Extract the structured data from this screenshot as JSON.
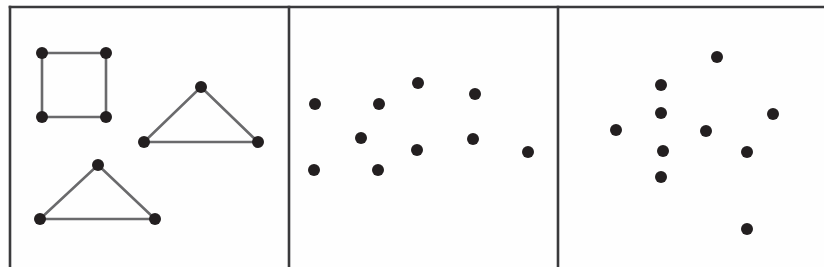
{
  "figure": {
    "background_color": "#fefefe",
    "width": 824,
    "height": 267,
    "frame_color": "#3a3a3c",
    "edge_color": "#6a6a6c",
    "dot_color": "#231f20",
    "dot_radius": 6,
    "frame": {
      "top_border": {
        "x1": 10,
        "y1": 7,
        "x2": 824,
        "y2": 7
      },
      "left_border": {
        "x1": 10,
        "y1": 7,
        "x2": 10,
        "y2": 267
      },
      "divider_1": {
        "x1": 289,
        "y1": 7,
        "x2": 289,
        "y2": 267
      },
      "divider_2": {
        "x1": 558,
        "y1": 7,
        "x2": 558,
        "y2": 267
      }
    },
    "panels": [
      {
        "id": "panel-1",
        "name": "connected-shapes-panel",
        "description": "Dots connected by line segments forming one square and two triangles",
        "shapes": [
          {
            "name": "square",
            "closed": true,
            "vertices": [
              {
                "x": 42,
                "y": 53
              },
              {
                "x": 106,
                "y": 53
              },
              {
                "x": 106,
                "y": 117
              },
              {
                "x": 42,
                "y": 117
              }
            ]
          },
          {
            "name": "upper-right-triangle",
            "closed": true,
            "vertices": [
              {
                "x": 201,
                "y": 87
              },
              {
                "x": 258,
                "y": 142
              },
              {
                "x": 144,
                "y": 142
              }
            ]
          },
          {
            "name": "lower-left-triangle",
            "closed": true,
            "vertices": [
              {
                "x": 98,
                "y": 165
              },
              {
                "x": 155,
                "y": 219
              },
              {
                "x": 40,
                "y": 219
              }
            ]
          }
        ]
      },
      {
        "id": "panel-2",
        "name": "scattered-dots-panel-middle",
        "description": "Nine unconnected scattered dots",
        "dots": [
          {
            "x": 315,
            "y": 104
          },
          {
            "x": 379,
            "y": 104
          },
          {
            "x": 418,
            "y": 83
          },
          {
            "x": 475,
            "y": 94
          },
          {
            "x": 361,
            "y": 138
          },
          {
            "x": 417,
            "y": 150
          },
          {
            "x": 473,
            "y": 139
          },
          {
            "x": 314,
            "y": 170
          },
          {
            "x": 378,
            "y": 170
          },
          {
            "x": 528,
            "y": 152
          }
        ]
      },
      {
        "id": "panel-3",
        "name": "scattered-dots-panel-right",
        "description": "Ten unconnected scattered dots forming a loose cross-like cluster",
        "dots": [
          {
            "x": 717,
            "y": 57
          },
          {
            "x": 661,
            "y": 85
          },
          {
            "x": 661,
            "y": 113
          },
          {
            "x": 773,
            "y": 114
          },
          {
            "x": 616,
            "y": 130
          },
          {
            "x": 706,
            "y": 131
          },
          {
            "x": 663,
            "y": 151
          },
          {
            "x": 747,
            "y": 152
          },
          {
            "x": 661,
            "y": 177
          },
          {
            "x": 747,
            "y": 229
          }
        ]
      }
    ]
  }
}
